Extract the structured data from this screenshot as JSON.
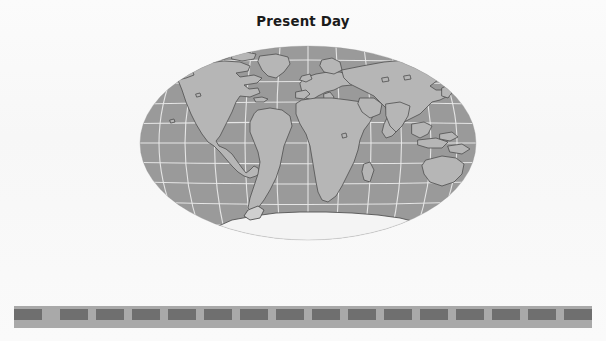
{
  "figure": {
    "title": "Present Day",
    "projection": "mollweide",
    "map": {
      "ocean_color": "#9a9a9a",
      "land_color": "#b6b6b6",
      "land_outline_color": "#545454",
      "graticule_color": "#e9e9e9",
      "outline_only_land_color": "#f4f4f4",
      "graticule_lat_step_deg": 20,
      "graticule_lon_step_deg": 30,
      "center_longitude_deg": 0,
      "regions": [
        {
          "name": "north-america",
          "filled": true
        },
        {
          "name": "greenland",
          "filled": true
        },
        {
          "name": "south-america",
          "filled": true
        },
        {
          "name": "africa",
          "filled": true
        },
        {
          "name": "europe",
          "filled": true
        },
        {
          "name": "asia",
          "filled": true
        },
        {
          "name": "australia",
          "filled": true
        },
        {
          "name": "antarctica",
          "filled": false
        }
      ]
    },
    "timescale_bar": {
      "base_color": "#a9a9a9",
      "block_color": "#6f6f6f",
      "block_count": 16,
      "label": ""
    },
    "background_color": "#fbfbfb"
  }
}
